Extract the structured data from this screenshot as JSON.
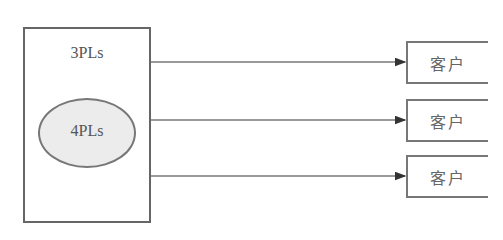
{
  "diagram": {
    "outer": {
      "label": "3PLs"
    },
    "inner": {
      "label": "4PLs"
    },
    "customers": [
      {
        "label": "客户"
      },
      {
        "label": "客户"
      },
      {
        "label": "客户"
      }
    ],
    "colors": {
      "stroke": "#666666",
      "ellipse_fill": "#ececec",
      "text": "#555555"
    }
  }
}
